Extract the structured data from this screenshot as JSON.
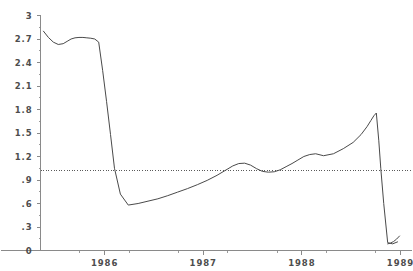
{
  "chart_data": {
    "type": "line",
    "title": "",
    "subtitle": "",
    "xlabel": "",
    "ylabel": "",
    "xlim": [
      1985.35,
      1989.0
    ],
    "ylim": [
      0,
      3
    ],
    "grid": false,
    "legend": null,
    "y_ticks": [
      0,
      0.3,
      0.6,
      0.9,
      1.2,
      1.5,
      1.8,
      2.1,
      2.4,
      2.7,
      3
    ],
    "y_tick_labels": [
      "0",
      ".3",
      ".6",
      ".9",
      "1.2",
      "1.5",
      "1.8",
      "2.1",
      "2.4",
      "2.7",
      "3"
    ],
    "x_ticks": [
      1986,
      1987,
      1988,
      1989
    ],
    "x_tick_labels": [
      "1986",
      "1987",
      "1988",
      "1989"
    ],
    "x_minor_ticks": [
      1985.75,
      1986.25,
      1986.75,
      1987.25,
      1987.75,
      1988.25,
      1988.75
    ],
    "annotations": [
      {
        "kind": "reference-line",
        "orientation": "horizontal",
        "value": 1.02,
        "style": "dotted"
      }
    ],
    "series": [
      {
        "name": "series-1",
        "color": "#4a4a4a",
        "x": [
          1985.38,
          1985.43,
          1985.48,
          1985.53,
          1985.58,
          1985.62,
          1985.66,
          1985.7,
          1985.74,
          1985.78,
          1985.82,
          1985.86,
          1985.9,
          1985.94,
          1985.98,
          1986.02,
          1986.06,
          1986.1,
          1986.16,
          1986.24,
          1986.34,
          1986.44,
          1986.54,
          1986.64,
          1986.74,
          1986.84,
          1986.94,
          1987.04,
          1987.14,
          1987.22,
          1987.3,
          1987.36,
          1987.42,
          1987.48,
          1987.54,
          1987.6,
          1987.66,
          1987.72,
          1987.78,
          1987.84,
          1987.9,
          1987.96,
          1988.02,
          1988.08,
          1988.14,
          1988.22,
          1988.32,
          1988.42,
          1988.52,
          1988.6,
          1988.66,
          1988.7,
          1988.73,
          1988.755,
          1988.78,
          1988.8,
          1988.83,
          1988.87,
          1988.92,
          1988.97
        ],
        "y": [
          2.8,
          2.72,
          2.66,
          2.63,
          2.64,
          2.67,
          2.7,
          2.715,
          2.72,
          2.72,
          2.715,
          2.71,
          2.7,
          2.66,
          2.3,
          1.9,
          1.48,
          1.05,
          0.72,
          0.58,
          0.6,
          0.63,
          0.66,
          0.7,
          0.745,
          0.79,
          0.84,
          0.895,
          0.96,
          1.02,
          1.08,
          1.11,
          1.115,
          1.09,
          1.045,
          1.01,
          1.0,
          1.005,
          1.03,
          1.07,
          1.11,
          1.155,
          1.2,
          1.225,
          1.235,
          1.21,
          1.235,
          1.3,
          1.38,
          1.48,
          1.58,
          1.66,
          1.72,
          1.755,
          1.4,
          1.05,
          0.6,
          0.1,
          0.085,
          0.11
        ],
        "tail_x": [
          1988.87,
          1988.9,
          1988.93,
          1988.96,
          1988.99
        ],
        "tail_y": [
          0.085,
          0.095,
          0.115,
          0.145,
          0.185
        ]
      }
    ]
  },
  "axes": {
    "y_axis_name": "value-axis",
    "x_axis_name": "time-axis"
  }
}
